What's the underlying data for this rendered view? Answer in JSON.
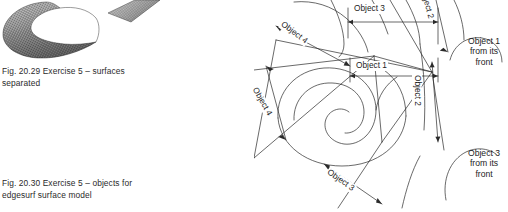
{
  "page": {
    "background_color": "#ffffff",
    "ink_color": "#1d1d1d"
  },
  "figures": [
    {
      "id": "fig-20-29",
      "caption": "Fig. 20.29  Exercise 5 – surfaces\nseparated",
      "graphic": "3d-mesh-surface-render",
      "description": "Two separated curved wireframe mesh surfaces rendered in grey"
    },
    {
      "id": "fig-20-30",
      "caption": "Fig. 20.30  Exercise 5 – objects for\nedgesurf surface model",
      "graphic": "2d-line-drawing-with-dimensions",
      "description": "Spiral scroll outline with four labelled boundary objects and two front views"
    }
  ],
  "drawing_labels": {
    "object_3_top": "Object 3",
    "object_1_mid": "Object 1",
    "object_4_diag": "Object 4",
    "object_4_low": "Object 4",
    "object_3_low": "Object 3",
    "object_2_top": "ject 2",
    "object_2_mid": "Object 2",
    "object_1_front": "Object 1\nfrom its\nfront",
    "object_3_front": "Object 3\nfrom its\nfront"
  }
}
